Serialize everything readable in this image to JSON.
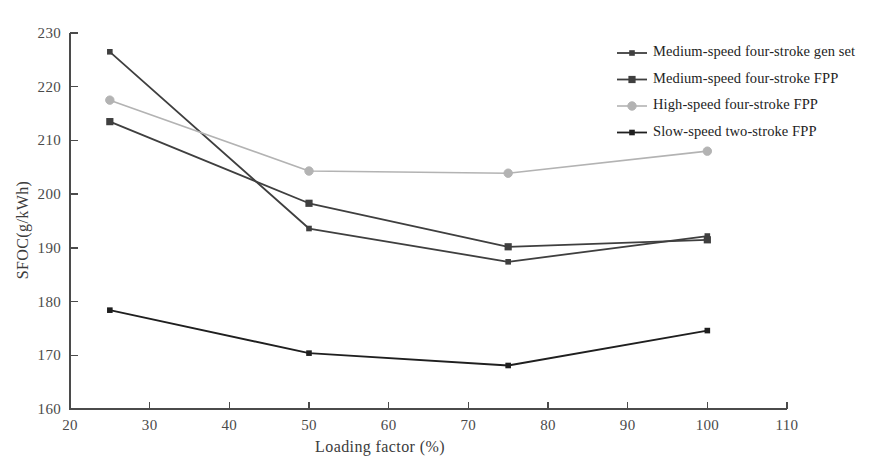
{
  "chart_data": {
    "type": "line",
    "title": "",
    "xlabel": "Loading factor (%)",
    "ylabel": "SFOC(g/kWh)",
    "x": [
      25,
      50,
      75,
      100
    ],
    "xlim": [
      20,
      110
    ],
    "ylim": [
      160,
      230
    ],
    "xticks": [
      20,
      30,
      40,
      50,
      60,
      70,
      80,
      90,
      100,
      110
    ],
    "yticks": [
      160,
      170,
      180,
      190,
      200,
      210,
      220,
      230
    ],
    "grid": false,
    "legend_position": "top-right",
    "series": [
      {
        "name": "Medium-speed four-stroke gen set",
        "values": [
          226.5,
          193.6,
          187.4,
          192.2
        ],
        "color": "#3f3f3f",
        "marker": "square-small"
      },
      {
        "name": "Medium-speed four-stroke FPP",
        "values": [
          213.5,
          198.3,
          190.2,
          191.5
        ],
        "color": "#3f3f3f",
        "marker": "square"
      },
      {
        "name": "High-speed four-stroke FPP",
        "values": [
          217.5,
          204.3,
          203.9,
          208.0
        ],
        "color": "#b3b3b3",
        "marker": "circle"
      },
      {
        "name": "Slow-speed two-stroke FPP",
        "values": [
          178.4,
          170.4,
          168.1,
          174.6
        ],
        "color": "#1f1f1f",
        "marker": "square-small"
      }
    ]
  },
  "axis": {
    "xtick_labels": [
      "20",
      "30",
      "40",
      "50",
      "60",
      "70",
      "80",
      "90",
      "100",
      "110"
    ],
    "ytick_labels": [
      "160",
      "170",
      "180",
      "190",
      "200",
      "210",
      "220",
      "230"
    ],
    "x_title": "Loading factor (%)",
    "y_title": "SFOC(g/kWh)"
  },
  "legend": {
    "items": [
      {
        "label": "Medium-speed four-stroke gen set"
      },
      {
        "label": "Medium-speed four-stroke FPP"
      },
      {
        "label": "High-speed four-stroke FPP"
      },
      {
        "label": "Slow-speed two-stroke FPP"
      }
    ]
  }
}
